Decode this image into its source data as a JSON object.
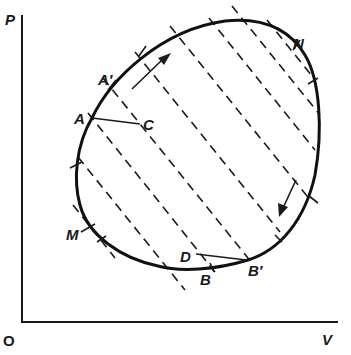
{
  "diagram": {
    "type": "P-V diagram of closed thermodynamic cycle decomposed by adiabatic lines",
    "axes": {
      "y_label": "P",
      "x_label": "V",
      "origin_label": "O"
    },
    "points": {
      "A": "A",
      "A_prime": "A′",
      "B": "B",
      "B_prime": "B′",
      "C": "C",
      "D": "D",
      "M": "M",
      "N": "N"
    },
    "direction": "clockwise",
    "dashed_line_count": 9,
    "colors": {
      "ink": "#1a1a1a",
      "background": "#ffffff"
    }
  }
}
